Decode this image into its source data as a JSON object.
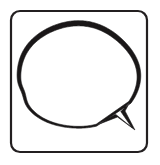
{
  "image": {
    "kind": "line-art-icon",
    "title": "Speech Bubble Icon",
    "caption": "Hand-drawn speech balloon inside a rounded square frame",
    "width": 160,
    "height": 165,
    "background_color": "#ffffff"
  },
  "colors": {
    "background": "#ffffff",
    "frame_stroke": "#231f20",
    "bubble_stroke": "#1a1718",
    "bubble_fill": "#ffffff"
  },
  "frame": {
    "name": "rounded-square-frame",
    "shape": "rounded-rectangle",
    "x": 11,
    "y": 11,
    "width": 136,
    "height": 141,
    "corner_radius": 9,
    "stroke_width": 2.2,
    "fill": "none"
  },
  "bubble": {
    "name": "speech-balloon",
    "shape": "oval-with-tail",
    "center_x": 78,
    "center_y": 76,
    "radius_x": 60,
    "radius_y": 52,
    "stroke_width_max": 5.2,
    "stroke_width_min": 1.8,
    "fill": "#ffffff",
    "tail": {
      "name": "speech-bubble-tail",
      "direction": "down-right",
      "notch_x": 122,
      "notch_y": 112,
      "tip_x": 134,
      "tip_y": 129
    },
    "notches": [
      {
        "name": "left-kink",
        "x": 21,
        "y": 97
      }
    ]
  },
  "elements": {
    "frame_label": "Rounded square frame",
    "bubble_label": "Speech balloon",
    "tail_label": "Balloon tail"
  }
}
